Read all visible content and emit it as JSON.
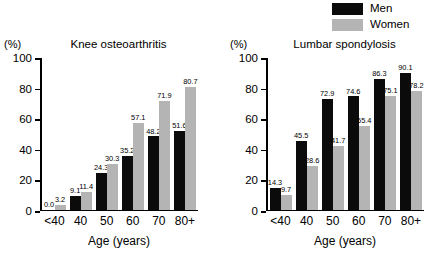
{
  "legend": {
    "position": "top-right",
    "entries": [
      {
        "label": "Men",
        "color": "#0b0b0b",
        "swatch": "men-swatch"
      },
      {
        "label": "Women",
        "color": "#b4b4b4",
        "swatch": "women-swatch"
      }
    ]
  },
  "axis": {
    "unit_label": "(%)",
    "xlabel": "Age (years)",
    "yticks": [
      "0",
      "20",
      "40",
      "60",
      "80",
      "100"
    ]
  },
  "chart_data": [
    {
      "type": "bar",
      "title": "Knee osteoarthritis",
      "xlabel": "Age (years)",
      "ylabel": "(%)",
      "ylim": [
        0,
        100
      ],
      "grid": false,
      "legend_position": "top-right",
      "categories": [
        "<40",
        "40",
        "50",
        "60",
        "70",
        "80+"
      ],
      "series": [
        {
          "name": "Men",
          "color": "#0b0b0b",
          "values": [
            0.0,
            9.1,
            24.3,
            35.2,
            48.2,
            51.6
          ],
          "labels": [
            "0.0",
            "9.1",
            "24.3",
            "35.2",
            "48.2",
            "51.6"
          ]
        },
        {
          "name": "Women",
          "color": "#b4b4b4",
          "values": [
            3.2,
            11.4,
            30.3,
            57.1,
            71.9,
            80.7
          ],
          "labels": [
            "3.2",
            "11.4",
            "30.3",
            "57.1",
            "71.9",
            "80.7"
          ]
        }
      ]
    },
    {
      "type": "bar",
      "title": "Lumbar spondylosis",
      "xlabel": "Age (years)",
      "ylabel": "(%)",
      "ylim": [
        0,
        100
      ],
      "grid": false,
      "legend_position": "top-right",
      "categories": [
        "<40",
        "40",
        "50",
        "60",
        "70",
        "80+"
      ],
      "series": [
        {
          "name": "Men",
          "color": "#0b0b0b",
          "values": [
            14.3,
            45.5,
            72.9,
            74.6,
            86.3,
            90.1
          ],
          "labels": [
            "14.3",
            "45.5",
            "72.9",
            "74.6",
            "86.3",
            "90.1"
          ]
        },
        {
          "name": "Women",
          "color": "#b4b4b4",
          "values": [
            9.7,
            28.6,
            41.7,
            55.4,
            75.1,
            78.2
          ],
          "labels": [
            "9.7",
            "28.6",
            "41.7",
            "55.4",
            "75.1",
            "78.2"
          ]
        }
      ]
    }
  ]
}
